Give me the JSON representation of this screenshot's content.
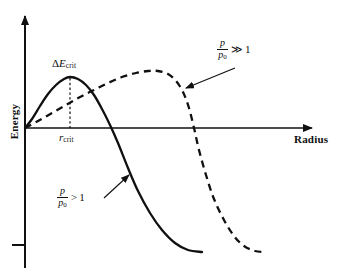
{
  "chart_data": {
    "type": "line",
    "title": "",
    "xlabel": "Radius",
    "ylabel": "Energy",
    "grid": false,
    "legend_position": "inline-annotations",
    "axis_style": "arrowed-axes-no-ticks",
    "x_axis": {
      "label": "Radius",
      "arrow": true,
      "tick_labels": [
        "r_crit"
      ],
      "origin_at_left": true
    },
    "y_axis": {
      "label": "Energy",
      "arrow": true,
      "tick_labels": [],
      "tick_marks": 1
    },
    "annotations": [
      {
        "name": "delta-e-crit",
        "text": "ΔE",
        "subscript": "crit",
        "role": "barrier-height",
        "x": 70,
        "y": 77
      },
      {
        "name": "r-crit",
        "text": "r",
        "subscript": "crit",
        "role": "critical-radius",
        "x": 70,
        "y": 128
      }
    ],
    "series": [
      {
        "name": "p/p0 > 1",
        "label_numerator": "p",
        "label_denominator": "p",
        "label_denominator_sub": "0",
        "relation": ">",
        "relation_value": "1",
        "style": "solid",
        "color": "#101010",
        "peak_energy_relative": 1.0,
        "peak_radius_relative": 0.26,
        "zero_crossing_radius_relative": 0.47,
        "points": [
          [
            25,
            128
          ],
          [
            32,
            119
          ],
          [
            40,
            106
          ],
          [
            48,
            94
          ],
          [
            56,
            85
          ],
          [
            64,
            79
          ],
          [
            70,
            77
          ],
          [
            78,
            79
          ],
          [
            86,
            85
          ],
          [
            94,
            95
          ],
          [
            102,
            109
          ],
          [
            110,
            125
          ],
          [
            118,
            143
          ],
          [
            128,
            168
          ],
          [
            138,
            191
          ],
          [
            150,
            213
          ],
          [
            162,
            230
          ],
          [
            175,
            243
          ],
          [
            188,
            250
          ],
          [
            202,
            252
          ]
        ]
      },
      {
        "name": "p/p0 >> 1",
        "label_numerator": "p",
        "label_denominator": "p",
        "label_denominator_sub": "0",
        "relation": "≫",
        "relation_value": "1",
        "style": "dashed",
        "color": "#101010",
        "peak_energy_relative": 1.1,
        "peak_radius_relative": 0.62,
        "zero_crossing_radius_relative": 0.86,
        "points": [
          [
            25,
            128
          ],
          [
            38,
            121
          ],
          [
            52,
            113
          ],
          [
            66,
            105
          ],
          [
            80,
            97
          ],
          [
            94,
            90
          ],
          [
            108,
            83
          ],
          [
            122,
            77
          ],
          [
            136,
            73
          ],
          [
            148,
            71
          ],
          [
            158,
            71
          ],
          [
            168,
            74
          ],
          [
            176,
            81
          ],
          [
            183,
            92
          ],
          [
            189,
            108
          ],
          [
            194,
            128
          ],
          [
            199,
            150
          ],
          [
            206,
            175
          ],
          [
            214,
            199
          ],
          [
            224,
            220
          ],
          [
            234,
            236
          ],
          [
            244,
            246
          ],
          [
            255,
            251
          ],
          [
            266,
            252
          ]
        ]
      }
    ],
    "leader_lines": [
      {
        "name": "strong-label-leader",
        "from": [
          235,
          68
        ],
        "to": [
          186,
          88
        ],
        "arrow_at": "to"
      },
      {
        "name": "weak-label-leader",
        "from": [
          104,
          198
        ],
        "to": [
          129,
          175
        ],
        "arrow_at": "to"
      }
    ]
  },
  "labels": {
    "y_axis_title": "Energy",
    "x_axis_title": "Radius",
    "delta_e": {
      "symbol": "ΔE",
      "delta": "Δ",
      "e": "E",
      "subscript": "crit"
    },
    "r_crit": {
      "symbol": "r",
      "subscript": "crit"
    },
    "series_strong": {
      "numerator": "p",
      "denominator": "p",
      "denominator_sub": "0",
      "relation": "≫",
      "value": "1"
    },
    "series_weak": {
      "numerator": "p",
      "denominator": "p",
      "denominator_sub": "0",
      "relation": ">",
      "value": "1"
    }
  },
  "colors": {
    "ink": "#101010",
    "background": "#ffffff"
  }
}
